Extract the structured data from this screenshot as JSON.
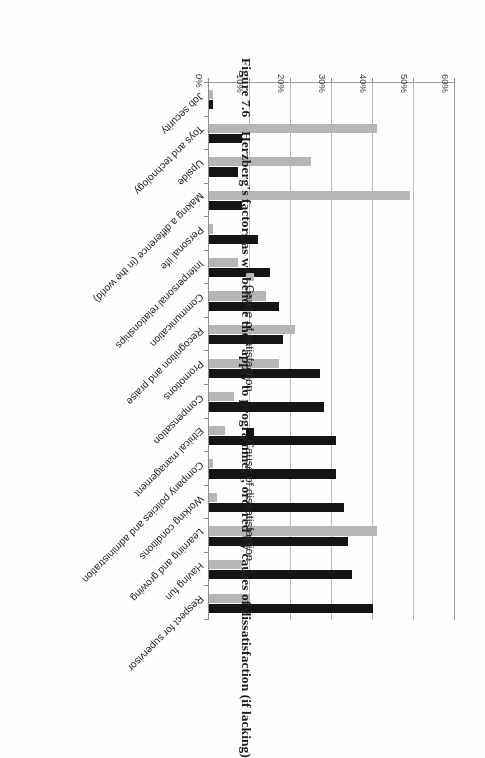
{
  "caption": {
    "figure_number": "Figure 7.6",
    "text": "Herzberg's factors as we believe they apply to programmers, ordered by causes of dissatisfaction (if lacking)"
  },
  "legend": {
    "items": [
      {
        "label": "Cause of satisfaction",
        "color": "#b6b6b6",
        "swatch_icon": "gray-square-icon"
      },
      {
        "label": "Cause of dissatisfaction",
        "color": "#151515",
        "swatch_icon": "black-square-icon"
      }
    ]
  },
  "chart_data": {
    "type": "bar",
    "orientation": "horizontal",
    "title": "Herzberg's factors as we believe they apply to programmers, ordered by causes of dissatisfaction (if lacking)",
    "xlabel": "",
    "ylabel": "",
    "xlim": [
      0,
      60
    ],
    "xticks": [
      "0%",
      "10%",
      "20%",
      "30%",
      "40%",
      "50%",
      "60%"
    ],
    "xtick_values": [
      0,
      10,
      20,
      30,
      40,
      50,
      60
    ],
    "grid": "vertical",
    "legend_position": "bottom",
    "value_unit": "%",
    "categories": [
      "Respect for supervisor",
      "Having fun",
      "Learning and growing",
      "Working conditions",
      "Company policies and administration",
      "Ethical management",
      "Compensation",
      "Promotions",
      "Recognition and praise",
      "Communication",
      "Interpersonal relationships",
      "Personal life",
      "Making a difference (in the world)",
      "Upside",
      "Toys and technology",
      "Job security"
    ],
    "series": [
      {
        "name": "Cause of dissatisfaction",
        "color": "#151515",
        "values": [
          40,
          35,
          34,
          33,
          31,
          31,
          28,
          27,
          18,
          17,
          15,
          12,
          8,
          7,
          8,
          1
        ]
      },
      {
        "name": "Cause of satisfaction",
        "color": "#b6b6b6",
        "values": [
          10,
          8,
          41,
          2,
          1,
          4,
          6,
          17,
          21,
          14,
          7,
          1,
          49,
          25,
          41,
          1
        ]
      }
    ]
  }
}
